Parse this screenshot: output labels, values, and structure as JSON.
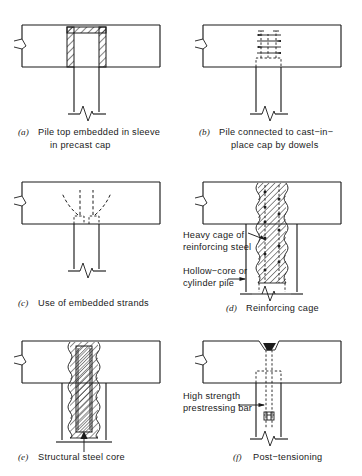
{
  "figure": {
    "type": "engineering-detail-diagram",
    "panel_count": 6,
    "layout": "2 columns x 3 rows",
    "colors": {
      "line": "#1b1b1b",
      "background": "#ffffff",
      "fill_solid": "#1b1b1b"
    }
  },
  "panels": [
    {
      "id": "a",
      "letter": "(a)",
      "caption_line1": "Pile top embedded in sleeve",
      "caption_line2": "in precast cap",
      "caption_full": "Pile top embedded in sleeve in precast cap",
      "elements": "precast cap with hatched sleeve walls and top, open pile socket, pile stem below with break symbol"
    },
    {
      "id": "b",
      "letter": "(b)",
      "caption_line1": "Pile connected to cast−in−",
      "caption_line2": "place cap by dowels",
      "caption_full": "Pile connected to cast-in-place cap by dowels",
      "elements": "cast-in-place cap with dashed dowel bars and ties projecting up from pile head"
    },
    {
      "id": "c",
      "letter": "(c)",
      "caption_line1": "Use of embedded strands",
      "caption_line2": "",
      "caption_full": "Use of embedded strands",
      "elements": "cap with dashed prestressing strands splayed outward from pile head"
    },
    {
      "id": "d",
      "letter": "(d)",
      "caption_line1": "Reinforcing cage",
      "caption_line2": "",
      "caption_full": "Reinforcing cage",
      "elements": "hollow-core pile with heavy reinforcing cage extending into cap, spiral ties shown as wavy edges"
    },
    {
      "id": "e",
      "letter": "(e)",
      "caption_line1": "Structural steel core",
      "caption_line2": "",
      "caption_full": "Structural steel core",
      "elements": "pile with concrete infill and structural steel core section extending into cap"
    },
    {
      "id": "f",
      "letter": "(f)",
      "caption_line1": "Post−tensioning",
      "caption_line2": "",
      "caption_full": "Post-tensioning",
      "elements": "cap with anchorage cone at top, dashed post-tensioning duct down through pile to anchor block"
    }
  ],
  "annotations": [
    {
      "id": "heavy-cage",
      "line1": "Heavy cage of",
      "line2": "reinforcing steel",
      "full": "Heavy cage of reinforcing steel",
      "panel": "d",
      "pointer": "arrow pointing right into reinforcing cage"
    },
    {
      "id": "hollow-core",
      "line1": "Hollow−core or",
      "line2": "cylinder pile",
      "full": "Hollow-core or cylinder pile",
      "panel": "d",
      "pointer": "arrow pointing right into pile wall"
    },
    {
      "id": "prestressing-bar",
      "line1": "High strength",
      "line2": "prestressing bar",
      "full": "High strength prestressing bar",
      "panel": "f",
      "pointer": "arrow pointing right into post-tensioning duct"
    }
  ]
}
